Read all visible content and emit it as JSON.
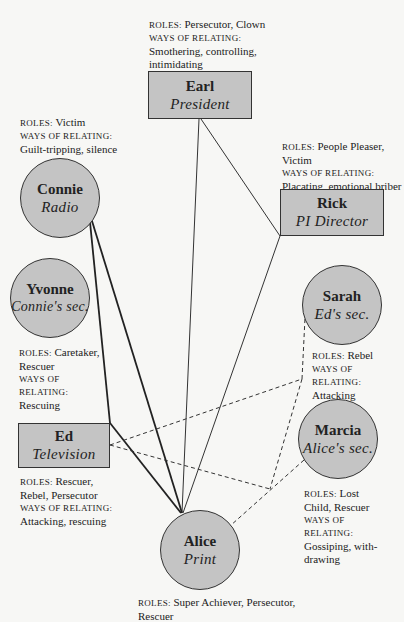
{
  "labels": {
    "roles": "ROLES:",
    "ways": "WAYS OF RELATING:"
  },
  "people": {
    "earl": {
      "name": "Earl",
      "title": "President",
      "roles": "Persecutor, Clown",
      "ways": "Smothering, controlling, intimidating"
    },
    "connie": {
      "name": "Connie",
      "title": "Radio",
      "roles": "Victim",
      "ways": "Guilt-tripping, silence"
    },
    "rick": {
      "name": "Rick",
      "title": "PI Director",
      "roles": "People Pleaser, Victim",
      "ways": "Placating, emotional briber"
    },
    "yvonne": {
      "name": "Yvonne",
      "title": "Connie's sec.",
      "roles": "Caretaker, Rescuer",
      "ways": "Rescuing"
    },
    "sarah": {
      "name": "Sarah",
      "title": "Ed's sec.",
      "roles": "Rebel",
      "ways": "Attacking"
    },
    "ed": {
      "name": "Ed",
      "title": "Television",
      "roles": "Rescuer, Rebel, Persecutor",
      "ways": "Attacking, rescuing"
    },
    "marcia": {
      "name": "Marcia",
      "title": "Alice's sec.",
      "roles": "Lost Child, Rescuer",
      "ways": "Gossiping, with-drawing"
    },
    "alice": {
      "name": "Alice",
      "title": "Print",
      "roles": "Super Achiever, Persecutor, Rescuer",
      "ways": ""
    }
  },
  "colors": {
    "node_fill": "#c4c4c4",
    "line": "#222222",
    "background": "#f7f7f5"
  },
  "edges": [
    {
      "from": "earl",
      "to": "alice",
      "style": "solid-thin"
    },
    {
      "from": "earl",
      "to": "rick",
      "style": "solid-thin"
    },
    {
      "from": "rick",
      "to": "alice",
      "style": "solid-thin"
    },
    {
      "from": "connie",
      "to": "alice",
      "style": "solid-heavy"
    },
    {
      "from": "connie",
      "to": "ed",
      "style": "solid-heavy"
    },
    {
      "from": "ed",
      "to": "alice",
      "style": "solid-heavy"
    },
    {
      "from": "ed",
      "to": "sarah",
      "style": "dashed"
    },
    {
      "from": "ed",
      "to": "marcia",
      "style": "dashed"
    },
    {
      "from": "sarah",
      "to": "marcia",
      "style": "dashed"
    },
    {
      "from": "marcia",
      "to": "alice",
      "style": "dashed"
    }
  ]
}
